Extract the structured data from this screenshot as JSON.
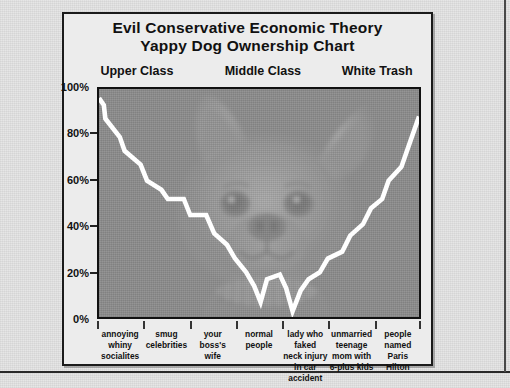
{
  "figure": {
    "title_line1": "Evil Conservative Economic Theory",
    "title_line2": "Yappy Dog Ownership Chart"
  },
  "class_headers": [
    {
      "label": "Upper Class",
      "left_pct": 8
    },
    {
      "label": "Middle Class",
      "left_pct": 43
    },
    {
      "label": "White Trash",
      "left_pct": 76
    }
  ],
  "watermark": {
    "name": "chihuahua-dog-photo-watermark",
    "description": "Faded photo of a chihuahua dog face filling the plot area"
  },
  "chart_data": {
    "type": "line",
    "title": "Evil Conservative Economic Theory Yappy Dog Ownership Chart",
    "xlabel": "",
    "ylabel": "",
    "ylim": [
      0,
      100
    ],
    "yticks": [
      0,
      20,
      40,
      60,
      80,
      100
    ],
    "ytick_labels": [
      "0%",
      "20%",
      "40%",
      "60%",
      "80%",
      "100%"
    ],
    "grid": false,
    "legend": null,
    "line_color": "#ffffff",
    "categories": [
      "annoying whiny socialites",
      "smug celebrities",
      "your boss's wife",
      "normal people",
      "lady who faked neck injury in car accident",
      "unmarried teenage mom with 6-plus kids",
      "people named Paris Hilton"
    ],
    "category_labels_multiline": [
      [
        "annoying",
        "whiny",
        "socialites"
      ],
      [
        "smug",
        "celebrities"
      ],
      [
        "your",
        "boss's",
        "wife"
      ],
      [
        "normal",
        "people"
      ],
      [
        "lady who faked",
        "neck injury in car",
        "accident"
      ],
      [
        "unmarried",
        "teenage",
        "mom with",
        "6-plus kids"
      ],
      [
        "people",
        "named",
        "Paris",
        "Hilton"
      ]
    ],
    "series": [
      {
        "name": "Yappy dog ownership",
        "note": "Stepped V-shaped curve: very high for the rich, falls to near zero for normal people, climbs back up for white trash",
        "points": [
          {
            "x": 0.0,
            "y": 96
          },
          {
            "x": 1.5,
            "y": 93
          },
          {
            "x": 2.0,
            "y": 87
          },
          {
            "x": 6.5,
            "y": 79
          },
          {
            "x": 8.0,
            "y": 73
          },
          {
            "x": 13.0,
            "y": 67
          },
          {
            "x": 15.0,
            "y": 60
          },
          {
            "x": 19.5,
            "y": 56
          },
          {
            "x": 21.5,
            "y": 52
          },
          {
            "x": 26.5,
            "y": 52
          },
          {
            "x": 28.5,
            "y": 45
          },
          {
            "x": 33.5,
            "y": 45
          },
          {
            "x": 36.0,
            "y": 37
          },
          {
            "x": 40.0,
            "y": 32
          },
          {
            "x": 42.5,
            "y": 26
          },
          {
            "x": 46.0,
            "y": 20
          },
          {
            "x": 48.5,
            "y": 14
          },
          {
            "x": 50.5,
            "y": 7
          },
          {
            "x": 52.5,
            "y": 17
          },
          {
            "x": 56.5,
            "y": 19
          },
          {
            "x": 58.5,
            "y": 13
          },
          {
            "x": 60.5,
            "y": 3
          },
          {
            "x": 63.0,
            "y": 12
          },
          {
            "x": 65.5,
            "y": 17
          },
          {
            "x": 69.0,
            "y": 20
          },
          {
            "x": 71.5,
            "y": 26
          },
          {
            "x": 76.0,
            "y": 29
          },
          {
            "x": 78.5,
            "y": 36
          },
          {
            "x": 82.5,
            "y": 41
          },
          {
            "x": 85.0,
            "y": 48
          },
          {
            "x": 88.5,
            "y": 52
          },
          {
            "x": 90.5,
            "y": 60
          },
          {
            "x": 94.5,
            "y": 66
          },
          {
            "x": 96.5,
            "y": 74
          },
          {
            "x": 100.0,
            "y": 88
          }
        ]
      }
    ]
  },
  "colors": {
    "page_background": "#e4e4e4",
    "frame_background": "#ececec",
    "plot_background": "#8d8d8d",
    "line": "#ffffff",
    "ink": "#111111"
  }
}
